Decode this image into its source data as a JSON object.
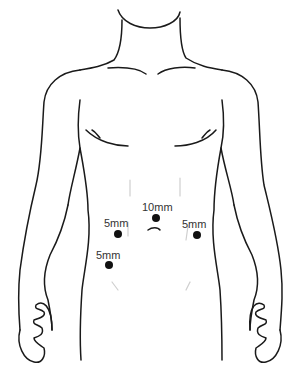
{
  "figure": {
    "line_color": "#1a1a1a",
    "dot_color": "#111111",
    "label_color": "#333333"
  },
  "ports": [
    {
      "id": "umbilical",
      "label": "10mm",
      "dot": {
        "x": 156,
        "y": 218
      },
      "label_pos": {
        "x": 142,
        "y": 202
      }
    },
    {
      "id": "left-upper",
      "label": "5mm",
      "dot": {
        "x": 118,
        "y": 234
      },
      "label_pos": {
        "x": 104,
        "y": 218
      }
    },
    {
      "id": "right-upper",
      "label": "5mm",
      "dot": {
        "x": 197,
        "y": 235
      },
      "label_pos": {
        "x": 182,
        "y": 219
      }
    },
    {
      "id": "left-lower",
      "label": "5mm",
      "dot": {
        "x": 109,
        "y": 265
      },
      "label_pos": {
        "x": 96,
        "y": 250
      }
    }
  ]
}
